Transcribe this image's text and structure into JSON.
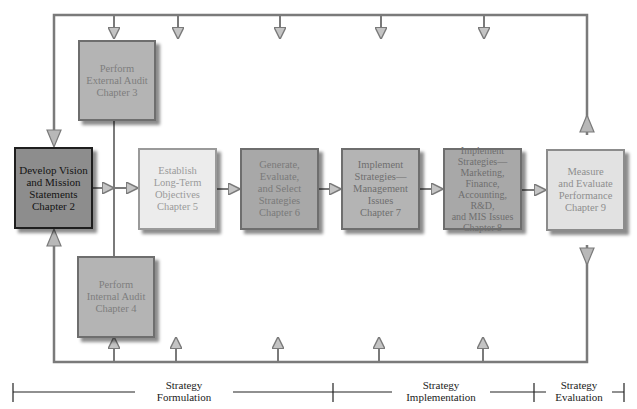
{
  "diagram": {
    "type": "strategic-management-process-flow",
    "boxes": [
      {
        "id": "external-audit",
        "label": "Perform\nExternal Audit\nChapter 3"
      },
      {
        "id": "vision-mission",
        "label": "Develop Vision\nand Mission\nStatements\nChapter 2"
      },
      {
        "id": "long-term-objectives",
        "label": "Establish\nLong-Term\nObjectives\nChapter 5"
      },
      {
        "id": "generate-strategies",
        "label": "Generate,\nEvaluate,\nand Select\nStrategies\nChapter 6"
      },
      {
        "id": "implement-management",
        "label": "Implement\nStrategies—\nManagement\nIssues\nChapter 7"
      },
      {
        "id": "implement-marketing",
        "label": "Implement\nStrategies—\nMarketing,\nFinance,\nAccounting, R&D,\nand MIS Issues\nChapter 8"
      },
      {
        "id": "measure-evaluate",
        "label": "Measure\nand Evaluate\nPerformance\nChapter 9"
      },
      {
        "id": "internal-audit",
        "label": "Perform\nInternal Audit\nChapter 4"
      }
    ],
    "phases": [
      {
        "id": "formulation",
        "label": "Strategy\nFormulation"
      },
      {
        "id": "implementation",
        "label": "Strategy\nImplementation"
      },
      {
        "id": "evaluation",
        "label": "Strategy\nEvaluation"
      }
    ],
    "colors": {
      "line": "#7a7a7a",
      "arrow_fill": "#b0b0b0",
      "dark_box": "#8d8d8d",
      "mid_box": "#b4b4b4",
      "light_box": "#ececec"
    }
  }
}
